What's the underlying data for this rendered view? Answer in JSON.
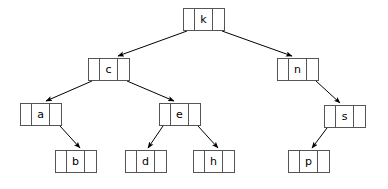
{
  "diagram": {
    "type": "binary-search-tree",
    "width": 388,
    "height": 189,
    "background_color": "#ffffff",
    "node_border_color": "#555555",
    "node_fill_color": "#ffffff",
    "edge_color": "#000000",
    "text_color": "#000000",
    "node_layout": "three-cell: left-pointer, key, right-pointer"
  },
  "nodes": [
    {
      "id": "k",
      "key": "k",
      "level": 0,
      "x": 183,
      "y": 8,
      "w": 42,
      "h": 23
    },
    {
      "id": "c",
      "key": "c",
      "level": 1,
      "x": 88,
      "y": 58,
      "w": 42,
      "h": 23
    },
    {
      "id": "n",
      "key": "n",
      "level": 1,
      "x": 277,
      "y": 58,
      "w": 42,
      "h": 23
    },
    {
      "id": "a",
      "key": "a",
      "level": 2,
      "x": 20,
      "y": 103,
      "w": 42,
      "h": 23
    },
    {
      "id": "e",
      "key": "e",
      "level": 2,
      "x": 159,
      "y": 103,
      "w": 42,
      "h": 23
    },
    {
      "id": "s",
      "key": "s",
      "level": 2,
      "x": 324,
      "y": 105,
      "w": 42,
      "h": 23
    },
    {
      "id": "b",
      "key": "b",
      "level": 3,
      "x": 55,
      "y": 150,
      "w": 42,
      "h": 23
    },
    {
      "id": "d",
      "key": "d",
      "level": 3,
      "x": 125,
      "y": 150,
      "w": 42,
      "h": 23
    },
    {
      "id": "h",
      "key": "h",
      "level": 3,
      "x": 193,
      "y": 150,
      "w": 42,
      "h": 23
    },
    {
      "id": "p",
      "key": "p",
      "level": 3,
      "x": 288,
      "y": 150,
      "w": 42,
      "h": 23
    }
  ],
  "edges": [
    {
      "from": "k",
      "to": "c",
      "side": "left",
      "x1": 187,
      "y1": 31,
      "x2": 118,
      "y2": 56
    },
    {
      "from": "k",
      "to": "n",
      "side": "right",
      "x1": 222,
      "y1": 31,
      "x2": 292,
      "y2": 56
    },
    {
      "from": "c",
      "to": "a",
      "side": "left",
      "x1": 92,
      "y1": 81,
      "x2": 46,
      "y2": 101
    },
    {
      "from": "c",
      "to": "e",
      "side": "right",
      "x1": 127,
      "y1": 81,
      "x2": 174,
      "y2": 101
    },
    {
      "from": "a",
      "to": "b",
      "side": "right",
      "x1": 60,
      "y1": 126,
      "x2": 80,
      "y2": 148
    },
    {
      "from": "e",
      "to": "d",
      "side": "left",
      "x1": 163,
      "y1": 126,
      "x2": 148,
      "y2": 148
    },
    {
      "from": "e",
      "to": "h",
      "side": "right",
      "x1": 198,
      "y1": 126,
      "x2": 218,
      "y2": 148
    },
    {
      "from": "n",
      "to": "s",
      "side": "right",
      "x1": 316,
      "y1": 81,
      "x2": 340,
      "y2": 103
    },
    {
      "from": "s",
      "to": "p",
      "side": "left",
      "x1": 327,
      "y1": 128,
      "x2": 312,
      "y2": 148
    }
  ]
}
